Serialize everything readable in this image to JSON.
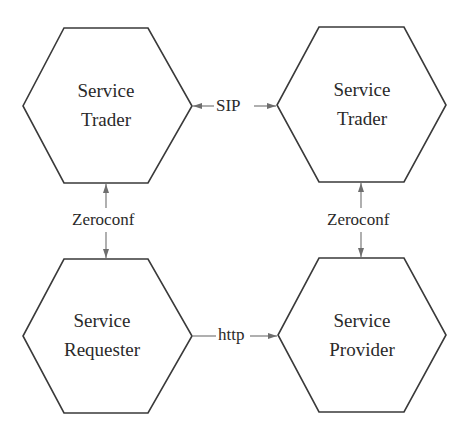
{
  "diagram": {
    "type": "architecture-diagram",
    "nodes": [
      {
        "id": "trader_left",
        "line1": "Service",
        "line2": "Trader"
      },
      {
        "id": "trader_right",
        "line1": "Service",
        "line2": "Trader"
      },
      {
        "id": "requester",
        "line1": "Service",
        "line2": "Requester"
      },
      {
        "id": "provider",
        "line1": "Service",
        "line2": "Provider"
      }
    ],
    "edges": [
      {
        "from": "trader_left",
        "to": "trader_right",
        "label": "SIP",
        "direction": "bidirectional"
      },
      {
        "from": "trader_left",
        "to": "requester",
        "label": "Zeroconf",
        "direction": "bidirectional"
      },
      {
        "from": "trader_right",
        "to": "provider",
        "label": "Zeroconf",
        "direction": "bidirectional"
      },
      {
        "from": "requester",
        "to": "provider",
        "label": "http",
        "direction": "requester-to-provider"
      }
    ],
    "colors": {
      "node_stroke": "#3a3a3a",
      "edge_stroke": "#6e6e6e",
      "text": "#2a2a2a",
      "background": "#ffffff"
    }
  }
}
